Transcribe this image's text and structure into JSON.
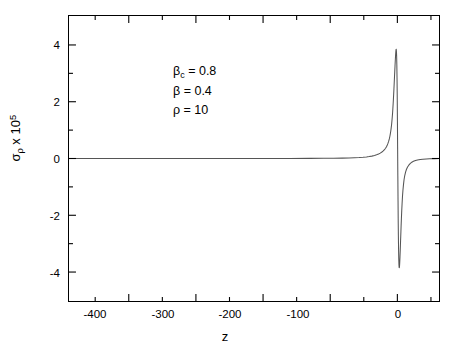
{
  "chart_data": {
    "type": "line",
    "title": "",
    "xlabel": "z",
    "ylabel": "σρ x 10^5",
    "ylabel_parts": {
      "base": "σ",
      "sub": "ρ",
      "mid": " x 10",
      "sup": "5"
    },
    "xlim": [
      -489,
      62
    ],
    "ylim": [
      -5.02,
      5.02
    ],
    "grid": false,
    "legend": null,
    "xticks": [
      -400,
      -300,
      -200,
      -100,
      0
    ],
    "xtick_labels": [
      "-400",
      "-300",
      "-200",
      "-100",
      "0"
    ],
    "xminor_ticks": [
      -450,
      -350,
      -250,
      -150,
      -50,
      50
    ],
    "yticks": [
      4,
      2,
      0,
      -2,
      -4
    ],
    "ytick_labels": [
      "4",
      "2",
      "0",
      "-2",
      "-4"
    ],
    "yminor_ticks": [
      3,
      1,
      -1,
      -3
    ],
    "line_color": "#555555",
    "line_width": 1.0,
    "series": [
      {
        "name": "sigma_rho",
        "description": "Dispersive resonance lineshape centred near z = 0: flat baseline at zero for z < -40, sharp rise to a positive maximum of about +3.85 at z ≈ -2, steep zero crossing at z ≈ 1.5, negative minimum of about -3.85 at z ≈ 5, then recovery toward zero by z ≈ 25.",
        "peak_value": 3.85,
        "peak_x": -2,
        "trough_value": -3.85,
        "trough_x": 5,
        "zero_crossing_x": 1.5,
        "baseline": 0,
        "x": [
          -489,
          -440,
          -400,
          -360,
          -320,
          -280,
          -240,
          -200,
          -160,
          -130,
          -110,
          -95,
          -82,
          -72,
          -64,
          -57,
          -51,
          -46,
          -42,
          -38,
          -34,
          -31,
          -28,
          -25.5,
          -23,
          -21,
          -19.2,
          -17.6,
          -16.2,
          -15,
          -13.9,
          -12.9,
          -12,
          -11.2,
          -10.5,
          -9.8,
          -9.2,
          -8.6,
          -8.1,
          -7.6,
          -7.1,
          -6.7,
          -6.3,
          -5.9,
          -5.5,
          -5.1,
          -4.7,
          -4.3,
          -3.9,
          -3.5,
          -3.1,
          -2.7,
          -2.3,
          -2,
          -1.7,
          -1.4,
          -1.1,
          -0.8,
          -0.5,
          -0.2,
          0.1,
          0.4,
          0.7,
          1,
          1.3,
          1.5,
          1.8,
          2.1,
          2.4,
          2.7,
          3,
          3.3,
          3.6,
          3.9,
          4.2,
          4.5,
          4.8,
          5,
          5.3,
          5.6,
          6,
          6.5,
          7,
          7.6,
          8.3,
          9.1,
          10,
          11,
          12.2,
          13.6,
          15.2,
          17,
          19,
          21.5,
          24,
          27,
          30,
          34,
          38,
          43,
          48,
          55,
          62
        ],
        "y": [
          0,
          0,
          0,
          0,
          0,
          0,
          0,
          0.001,
          0.002,
          0.004,
          0.006,
          0.009,
          0.013,
          0.018,
          0.024,
          0.032,
          0.042,
          0.054,
          0.067,
          0.084,
          0.107,
          0.13,
          0.158,
          0.19,
          0.228,
          0.266,
          0.31,
          0.36,
          0.415,
          0.475,
          0.54,
          0.61,
          0.69,
          0.775,
          0.865,
          0.97,
          1.08,
          1.2,
          1.32,
          1.46,
          1.61,
          1.76,
          1.92,
          2.09,
          2.27,
          2.46,
          2.66,
          2.86,
          3.06,
          3.26,
          3.45,
          3.62,
          3.76,
          3.84,
          3.85,
          3.78,
          3.62,
          3.32,
          2.85,
          2.18,
          1.3,
          0.35,
          -0.6,
          -1.5,
          -2.3,
          -2.72,
          -3.22,
          -3.55,
          -3.76,
          -3.85,
          -3.84,
          -3.76,
          -3.63,
          -3.47,
          -3.28,
          -3.08,
          -2.88,
          -2.76,
          -2.56,
          -2.36,
          -2.12,
          -1.84,
          -1.6,
          -1.35,
          -1.12,
          -0.92,
          -0.74,
          -0.6,
          -0.48,
          -0.38,
          -0.3,
          -0.235,
          -0.18,
          -0.13,
          -0.098,
          -0.07,
          -0.05,
          -0.034,
          -0.023,
          -0.015,
          -0.009,
          -0.005,
          -0.002
        ]
      }
    ],
    "annotations": [
      {
        "id": "beta-c",
        "text": "βc = 0.8",
        "symbol": "β",
        "subscript": "c",
        "value": "0.8"
      },
      {
        "id": "beta",
        "text": "β = 0.4",
        "symbol": "β",
        "subscript": "",
        "value": "0.4"
      },
      {
        "id": "rho",
        "text": "ρ = 10",
        "symbol": "ρ",
        "subscript": "",
        "value": "10"
      }
    ]
  },
  "axes": {
    "x_title": "z",
    "y_title_base": "σ",
    "y_title_sub": "ρ",
    "y_title_mid": " x 10",
    "y_title_sup": "5"
  },
  "annotation_lines": {
    "line1_symbol": "β",
    "line1_sub": "c",
    "line1_rest": " = 0.8",
    "line2_symbol": "β",
    "line2_rest": " = 0.4",
    "line3_symbol": "ρ",
    "line3_rest": " = 10"
  }
}
